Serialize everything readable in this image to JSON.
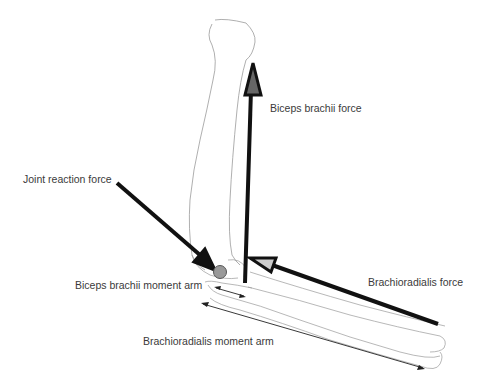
{
  "labels": {
    "biceps_force": "Biceps brachii force",
    "joint_reaction": "Joint reaction force",
    "brachioradialis_force": "Brachioradialis force",
    "biceps_moment_arm": "Biceps brachii moment arm",
    "brachioradialis_moment_arm": "Brachioradialis moment arm"
  },
  "colors": {
    "bone_outline": "#9a9a9a",
    "force_arrow": "#111111",
    "joint_center": "#9a9a9a",
    "arrowhead_fill_biceps": "#666666",
    "arrowhead_fill_brachio": "#cccccc",
    "text": "#3a3a3a"
  },
  "elements": {
    "humerus": "upper arm bone outline",
    "forearm": "radius and ulna outline",
    "joint_center": "elbow joint axis circle"
  }
}
